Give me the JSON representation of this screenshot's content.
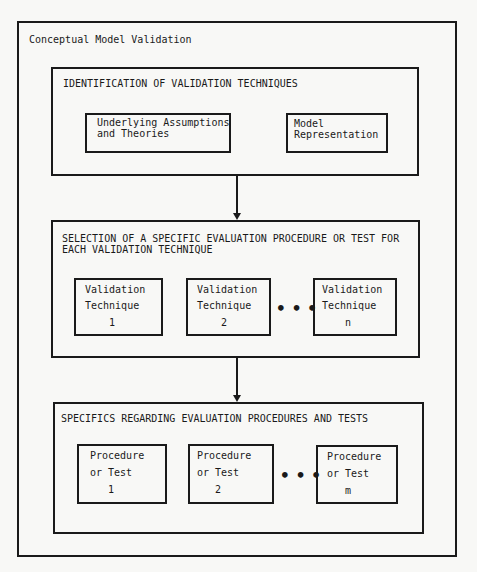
{
  "outer": {
    "title": "Conceptual Model Validation"
  },
  "stage1": {
    "title": "IDENTIFICATION OF VALIDATION TECHNIQUES",
    "items": [
      {
        "line1": "Underlying Assumptions",
        "line2": "and Theories"
      },
      {
        "line1": "Model",
        "line2": "Representation"
      }
    ]
  },
  "stage2": {
    "title_line1": "SELECTION OF A SPECIFIC EVALUATION PROCEDURE OR TEST FOR",
    "title_line2": "EACH VALIDATION TECHNIQUE",
    "items": [
      {
        "line1": "Validation",
        "line2": "Technique",
        "index": "1"
      },
      {
        "line1": "Validation",
        "line2": "Technique",
        "index": "2"
      },
      {
        "line1": "Validation",
        "line2": "Technique",
        "index": "n"
      }
    ],
    "ellipsis": "•••"
  },
  "stage3": {
    "title": "SPECIFICS REGARDING EVALUATION PROCEDURES AND TESTS",
    "items": [
      {
        "line1": "Procedure",
        "line2": "or Test",
        "index": "1"
      },
      {
        "line1": "Procedure",
        "line2": "or Test",
        "index": "2"
      },
      {
        "line1": "Procedure",
        "line2": "or Test",
        "index": "m"
      }
    ],
    "ellipsis": "•••"
  }
}
